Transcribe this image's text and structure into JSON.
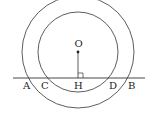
{
  "diagram": {
    "type": "geometry",
    "colors": {
      "stroke": "#333333",
      "text": "#222222",
      "background": "#ffffff"
    },
    "center": {
      "label": "O",
      "x": 78,
      "y": 52
    },
    "outer_circle": {
      "r": 56
    },
    "inner_circle": {
      "r": 40
    },
    "line": {
      "x1": 13,
      "x2": 145,
      "y": 78
    },
    "points": [
      {
        "label": "A",
        "x": 27
      },
      {
        "label": "C",
        "x": 45
      },
      {
        "label": "H",
        "x": 78
      },
      {
        "label": "D",
        "x": 113
      },
      {
        "label": "B",
        "x": 131
      }
    ],
    "right_angle_marker_at": "H"
  }
}
